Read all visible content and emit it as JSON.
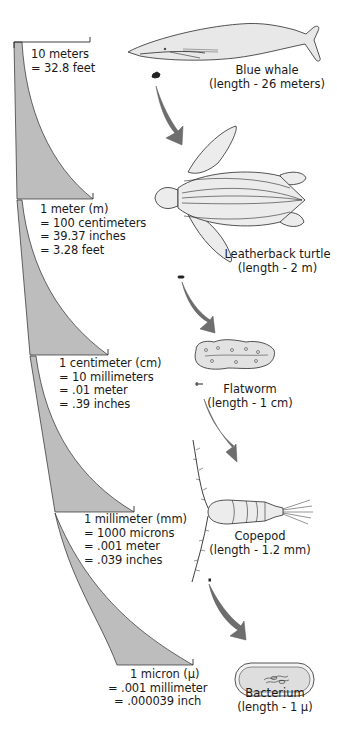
{
  "colors": {
    "background": "#ffffff",
    "wedge_fill": "#bdbdbd",
    "arrow_fill": "#6e6e6e",
    "line": "#2a2a2a",
    "organism_fill": "#ececec",
    "text": "#1a1a1a"
  },
  "scale_levels": [
    {
      "id": "10m",
      "lines": [
        "10 meters",
        "= 32.8 feet"
      ]
    },
    {
      "id": "1m",
      "lines": [
        "1 meter (m)",
        "= 100 centimeters",
        "= 39.37 inches",
        "= 3.28 feet"
      ]
    },
    {
      "id": "1cm",
      "lines": [
        "1 centimeter (cm)",
        "= 10 millimeters",
        "= .01 meter",
        "= .39 inches"
      ]
    },
    {
      "id": "1mm",
      "lines": [
        "1 millimeter (mm)",
        "= 1000 microns",
        "= .001 meter",
        "= .039 inches"
      ]
    },
    {
      "id": "1micron",
      "lines": [
        "1 micron (μ)",
        "= .001 millimeter",
        "= .000039 inch"
      ]
    }
  ],
  "organisms": [
    {
      "id": "blue-whale",
      "name": "Blue whale",
      "length": "(length - 26 meters)"
    },
    {
      "id": "leatherback-turtle",
      "name": "Leatherback turtle",
      "length": "(length - 2 m)"
    },
    {
      "id": "flatworm",
      "name": "Flatworm",
      "length": "(length - 1 cm)"
    },
    {
      "id": "copepod",
      "name": "Copepod",
      "length": "(length - 1.2 mm)"
    },
    {
      "id": "bacterium",
      "name": "Bacterium",
      "length": "(length - 1 μ)"
    }
  ]
}
